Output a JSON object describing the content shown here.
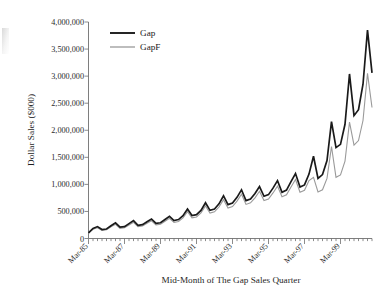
{
  "chart_data": {
    "type": "line",
    "title": "",
    "xlabel": "Mid-Month of The Gap Sales Quarter",
    "ylabel": "Dollar Sales ($000)",
    "ylim": [
      0,
      4000000
    ],
    "ytick_labels": [
      "0",
      "500,000",
      "1,000,000",
      "1,500,000",
      "2,000,000",
      "2,500,000",
      "3,000,000",
      "3,500,000",
      "4,000,000"
    ],
    "ytick_values": [
      0,
      500000,
      1000000,
      1500000,
      2000000,
      2500000,
      3000000,
      3500000,
      4000000
    ],
    "xtick_labels": [
      "Mar-85",
      "Mar-87",
      "Mar-89",
      "Mar-91",
      "Mar-93",
      "Mar-95",
      "Mar-97",
      "Mar-99"
    ],
    "xtick_indices": [
      0,
      8,
      16,
      24,
      32,
      40,
      48,
      56
    ],
    "grid": false,
    "legend_position": "upper-left-inside",
    "x_minor_tick_interval_quarters": 1,
    "x_major_tick_interval_quarters": 8,
    "n_points": 64,
    "series": [
      {
        "name": "Gap",
        "color": "#1a1a1a",
        "line_width": 1.7,
        "values": [
          105000,
          185000,
          220000,
          165000,
          175000,
          235000,
          290000,
          210000,
          220000,
          275000,
          330000,
          245000,
          255000,
          310000,
          360000,
          280000,
          290000,
          350000,
          410000,
          330000,
          350000,
          420000,
          545000,
          425000,
          440000,
          520000,
          660000,
          520000,
          545000,
          640000,
          790000,
          625000,
          655000,
          760000,
          900000,
          700000,
          730000,
          830000,
          960000,
          780000,
          810000,
          930000,
          1070000,
          855000,
          895000,
          1050000,
          1200000,
          950000,
          990000,
          1190000,
          1520000,
          1110000,
          1180000,
          1440000,
          2160000,
          1680000,
          1740000,
          2110000,
          3040000,
          2270000,
          2380000,
          2850000,
          3850000,
          3060000
        ]
      },
      {
        "name": "GapF",
        "color": "#9a9a9a",
        "line_width": 1.1,
        "values": [
          100000,
          170000,
          200000,
          150000,
          160000,
          215000,
          262000,
          188000,
          198000,
          250000,
          300000,
          220000,
          230000,
          282000,
          328000,
          252000,
          262000,
          318000,
          372000,
          296000,
          315000,
          382000,
          495000,
          382000,
          398000,
          474000,
          600000,
          470000,
          492000,
          582000,
          718000,
          562000,
          590000,
          690000,
          818000,
          630000,
          658000,
          752000,
          872000,
          702000,
          730000,
          842000,
          968000,
          770000,
          806000,
          952000,
          1090000,
          855000,
          890000,
          1070000,
          1130000,
          860000,
          900000,
          1110000,
          1700000,
          1130000,
          1175000,
          1430000,
          2150000,
          1725000,
          1810000,
          2180000,
          3050000,
          2420000
        ]
      }
    ]
  },
  "legend": {
    "entries": [
      {
        "label": "Gap"
      },
      {
        "label": "GapF"
      }
    ]
  },
  "axes": {
    "y_title": "Dollar Sales ($000)",
    "x_title": "Mid-Month of The Gap Sales Quarter"
  }
}
